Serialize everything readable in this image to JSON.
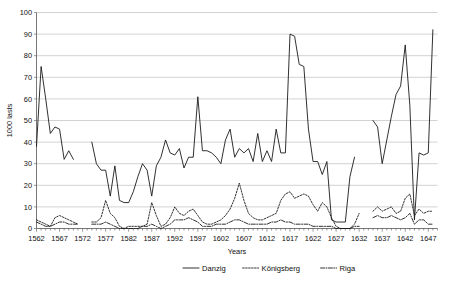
{
  "chart_data": {
    "type": "line",
    "title": "",
    "xlabel": "Years",
    "ylabel": "1000 lasts",
    "xlim": [
      1562,
      1649
    ],
    "ylim": [
      0,
      100
    ],
    "ytick_step": 10,
    "yticks": [
      0,
      10,
      20,
      30,
      40,
      50,
      60,
      70,
      80,
      90,
      100
    ],
    "xticks": [
      1562,
      1567,
      1572,
      1577,
      1582,
      1587,
      1592,
      1597,
      1602,
      1607,
      1612,
      1617,
      1622,
      1627,
      1632,
      1637,
      1642,
      1647
    ],
    "minor_xtick_every": 1,
    "grid": "horizontal",
    "legend_position": "bottom",
    "series": [
      {
        "name": "Danzig",
        "style": "solid",
        "color": "#1a1a1a",
        "points": [
          [
            1562,
            38
          ],
          [
            1563,
            75
          ],
          [
            1564,
            60
          ],
          [
            1565,
            44
          ],
          [
            1566,
            47
          ],
          [
            1567,
            46
          ],
          [
            1568,
            32
          ],
          [
            1569,
            36
          ],
          [
            1570,
            32
          ],
          [
            1574,
            40
          ],
          [
            1575,
            30
          ],
          [
            1576,
            27
          ],
          [
            1577,
            27
          ],
          [
            1578,
            15
          ],
          [
            1579,
            29
          ],
          [
            1580,
            13
          ],
          [
            1581,
            12
          ],
          [
            1582,
            12
          ],
          [
            1583,
            17
          ],
          [
            1584,
            24
          ],
          [
            1585,
            30
          ],
          [
            1586,
            27
          ],
          [
            1587,
            15
          ],
          [
            1588,
            29
          ],
          [
            1589,
            33
          ],
          [
            1590,
            41
          ],
          [
            1591,
            35
          ],
          [
            1592,
            34
          ],
          [
            1593,
            37
          ],
          [
            1594,
            28
          ],
          [
            1595,
            33
          ],
          [
            1596,
            33
          ],
          [
            1597,
            61
          ],
          [
            1598,
            36
          ],
          [
            1599,
            36
          ],
          [
            1600,
            35
          ],
          [
            1601,
            33
          ],
          [
            1602,
            30
          ],
          [
            1603,
            41
          ],
          [
            1604,
            46
          ],
          [
            1605,
            33
          ],
          [
            1606,
            37
          ],
          [
            1607,
            35
          ],
          [
            1608,
            37
          ],
          [
            1609,
            31
          ],
          [
            1610,
            44
          ],
          [
            1611,
            31
          ],
          [
            1612,
            36
          ],
          [
            1613,
            31
          ],
          [
            1614,
            46
          ],
          [
            1615,
            35
          ],
          [
            1616,
            35
          ],
          [
            1617,
            90
          ],
          [
            1618,
            89
          ],
          [
            1619,
            76
          ],
          [
            1620,
            75
          ],
          [
            1621,
            46
          ],
          [
            1622,
            31
          ],
          [
            1623,
            31
          ],
          [
            1624,
            25
          ],
          [
            1625,
            31
          ],
          [
            1626,
            4
          ],
          [
            1627,
            3
          ],
          [
            1628,
            3
          ],
          [
            1629,
            3
          ],
          [
            1630,
            24
          ],
          [
            1631,
            33
          ],
          [
            1635,
            50
          ],
          [
            1636,
            47
          ],
          [
            1637,
            30
          ],
          [
            1638,
            41
          ],
          [
            1639,
            52
          ],
          [
            1640,
            62
          ],
          [
            1641,
            66
          ],
          [
            1642,
            85
          ],
          [
            1643,
            57
          ],
          [
            1644,
            4
          ],
          [
            1645,
            35
          ],
          [
            1646,
            34
          ],
          [
            1647,
            35
          ],
          [
            1648,
            92
          ]
        ]
      },
      {
        "name": "Königsberg",
        "style": "dotted",
        "color": "#1a1a1a",
        "points": [
          [
            1562,
            4
          ],
          [
            1563,
            3
          ],
          [
            1564,
            2
          ],
          [
            1565,
            1
          ],
          [
            1566,
            5
          ],
          [
            1567,
            6
          ],
          [
            1568,
            5
          ],
          [
            1569,
            4
          ],
          [
            1570,
            3
          ],
          [
            1571,
            2
          ],
          [
            1574,
            3
          ],
          [
            1575,
            3
          ],
          [
            1576,
            5
          ],
          [
            1577,
            13
          ],
          [
            1578,
            7
          ],
          [
            1579,
            5
          ],
          [
            1580,
            1
          ],
          [
            1581,
            0
          ],
          [
            1582,
            1
          ],
          [
            1583,
            1
          ],
          [
            1584,
            1
          ],
          [
            1585,
            1
          ],
          [
            1586,
            2
          ],
          [
            1587,
            12
          ],
          [
            1588,
            6
          ],
          [
            1589,
            1
          ],
          [
            1590,
            2
          ],
          [
            1591,
            5
          ],
          [
            1592,
            10
          ],
          [
            1593,
            7
          ],
          [
            1594,
            6
          ],
          [
            1595,
            8
          ],
          [
            1596,
            9
          ],
          [
            1597,
            6
          ],
          [
            1598,
            3
          ],
          [
            1599,
            2
          ],
          [
            1600,
            2
          ],
          [
            1601,
            3
          ],
          [
            1602,
            4
          ],
          [
            1603,
            6
          ],
          [
            1604,
            9
          ],
          [
            1605,
            14
          ],
          [
            1606,
            21
          ],
          [
            1607,
            13
          ],
          [
            1608,
            7
          ],
          [
            1609,
            5
          ],
          [
            1610,
            4
          ],
          [
            1611,
            4
          ],
          [
            1612,
            5
          ],
          [
            1613,
            6
          ],
          [
            1614,
            7
          ],
          [
            1615,
            13
          ],
          [
            1616,
            16
          ],
          [
            1617,
            17
          ],
          [
            1618,
            14
          ],
          [
            1619,
            15
          ],
          [
            1620,
            16
          ],
          [
            1621,
            15
          ],
          [
            1622,
            11
          ],
          [
            1623,
            8
          ],
          [
            1624,
            12
          ],
          [
            1625,
            10
          ],
          [
            1626,
            5
          ],
          [
            1627,
            1
          ],
          [
            1628,
            0
          ],
          [
            1629,
            0
          ],
          [
            1630,
            0
          ],
          [
            1631,
            2
          ],
          [
            1632,
            7
          ],
          [
            1635,
            8
          ],
          [
            1636,
            10
          ],
          [
            1637,
            8
          ],
          [
            1638,
            9
          ],
          [
            1639,
            10
          ],
          [
            1640,
            7
          ],
          [
            1641,
            8
          ],
          [
            1642,
            14
          ],
          [
            1643,
            16
          ],
          [
            1644,
            6
          ],
          [
            1645,
            9
          ],
          [
            1646,
            7
          ],
          [
            1647,
            8
          ],
          [
            1648,
            8
          ]
        ]
      },
      {
        "name": "Riga",
        "style": "dash-dot",
        "color": "#1a1a1a",
        "points": [
          [
            1562,
            3
          ],
          [
            1563,
            2
          ],
          [
            1564,
            1
          ],
          [
            1565,
            1
          ],
          [
            1566,
            2
          ],
          [
            1567,
            3
          ],
          [
            1568,
            3
          ],
          [
            1569,
            2
          ],
          [
            1570,
            2
          ],
          [
            1571,
            2
          ],
          [
            1574,
            2
          ],
          [
            1575,
            2
          ],
          [
            1576,
            2
          ],
          [
            1577,
            3
          ],
          [
            1578,
            2
          ],
          [
            1579,
            1
          ],
          [
            1580,
            0
          ],
          [
            1581,
            0
          ],
          [
            1582,
            0
          ],
          [
            1583,
            0
          ],
          [
            1584,
            0
          ],
          [
            1585,
            1
          ],
          [
            1586,
            1
          ],
          [
            1587,
            2
          ],
          [
            1588,
            1
          ],
          [
            1589,
            0
          ],
          [
            1590,
            1
          ],
          [
            1591,
            2
          ],
          [
            1592,
            4
          ],
          [
            1593,
            4
          ],
          [
            1594,
            4
          ],
          [
            1595,
            5
          ],
          [
            1596,
            4
          ],
          [
            1597,
            3
          ],
          [
            1598,
            1
          ],
          [
            1599,
            1
          ],
          [
            1600,
            1
          ],
          [
            1601,
            2
          ],
          [
            1602,
            2
          ],
          [
            1603,
            2
          ],
          [
            1604,
            3
          ],
          [
            1605,
            4
          ],
          [
            1606,
            4
          ],
          [
            1607,
            3
          ],
          [
            1608,
            2
          ],
          [
            1609,
            2
          ],
          [
            1610,
            2
          ],
          [
            1611,
            2
          ],
          [
            1612,
            2
          ],
          [
            1613,
            3
          ],
          [
            1614,
            3
          ],
          [
            1615,
            4
          ],
          [
            1616,
            3
          ],
          [
            1617,
            3
          ],
          [
            1618,
            2
          ],
          [
            1619,
            2
          ],
          [
            1620,
            2
          ],
          [
            1621,
            2
          ],
          [
            1622,
            1
          ],
          [
            1623,
            1
          ],
          [
            1624,
            1
          ],
          [
            1625,
            1
          ],
          [
            1626,
            1
          ],
          [
            1627,
            0
          ],
          [
            1628,
            0
          ],
          [
            1629,
            0
          ],
          [
            1630,
            0
          ],
          [
            1631,
            1
          ],
          [
            1632,
            1
          ],
          [
            1635,
            5
          ],
          [
            1636,
            6
          ],
          [
            1637,
            5
          ],
          [
            1638,
            5
          ],
          [
            1639,
            6
          ],
          [
            1640,
            5
          ],
          [
            1641,
            4
          ],
          [
            1642,
            5
          ],
          [
            1643,
            7
          ],
          [
            1644,
            2
          ],
          [
            1645,
            4
          ],
          [
            1646,
            4
          ],
          [
            1647,
            2
          ],
          [
            1648,
            2
          ]
        ]
      }
    ],
    "legend": [
      {
        "label": "Danzig",
        "style": "solid"
      },
      {
        "label": "Königsberg",
        "style": "dotted"
      },
      {
        "label": "Riga",
        "style": "dash-dot"
      }
    ]
  }
}
